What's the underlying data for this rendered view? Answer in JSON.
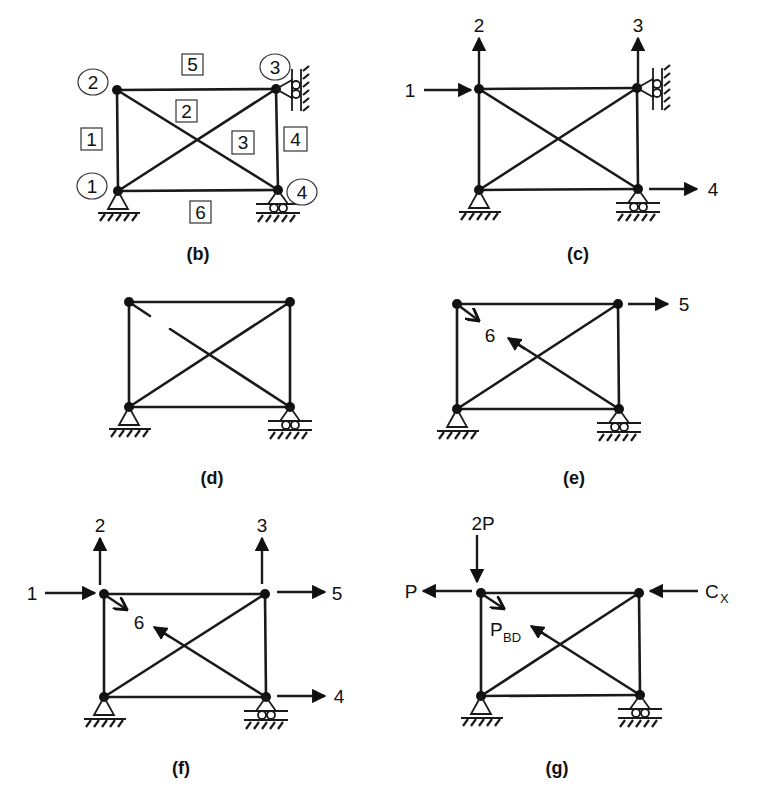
{
  "figure": {
    "panels": [
      {
        "id": "b",
        "caption": "(b)",
        "node_labels": [
          "1",
          "2",
          "3",
          "4"
        ],
        "member_labels": [
          "1",
          "2",
          "3",
          "4",
          "5",
          "6"
        ]
      },
      {
        "id": "c",
        "caption": "(c)",
        "dof_labels": [
          "1",
          "2",
          "3",
          "4"
        ]
      },
      {
        "id": "d",
        "caption": "(d)"
      },
      {
        "id": "e",
        "caption": "(e)",
        "dof_labels": [
          "5",
          "6"
        ]
      },
      {
        "id": "f",
        "caption": "(f)",
        "dof_labels": [
          "1",
          "2",
          "3",
          "4",
          "5",
          "6"
        ]
      },
      {
        "id": "g",
        "caption": "(g)",
        "force_labels": {
          "vertical_load": "2P",
          "horizontal_load": "P",
          "member_force_main": "P",
          "member_force_sub": "BD",
          "reaction_main": "C",
          "reaction_sub": "X"
        }
      }
    ]
  },
  "colors": {
    "ink": "#1a1a1a",
    "background": "#ffffff"
  }
}
